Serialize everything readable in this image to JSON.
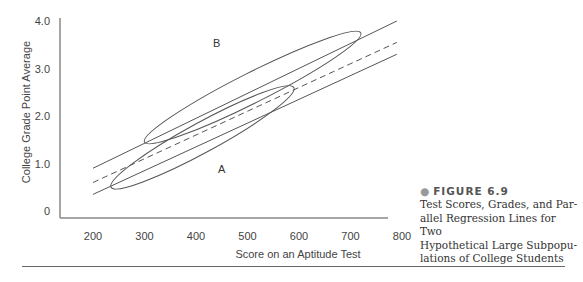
{
  "chart_data": {
    "type": "line",
    "title": "",
    "xlabel": "Score on an Aptitude Test",
    "ylabel": "College Grade Point Average",
    "xlim": [
      140,
      820
    ],
    "ylim": [
      -0.15,
      4.05
    ],
    "x_ticks": [
      200,
      300,
      400,
      500,
      600,
      700,
      800
    ],
    "x_tick_labels": [
      "200",
      "300",
      "400",
      "500",
      "600",
      "700",
      "800"
    ],
    "y_ticks": [
      0,
      1,
      2,
      3,
      4
    ],
    "y_tick_labels": [
      "0",
      "1.0",
      "2.0",
      "3.0",
      "4.0"
    ],
    "grid": false,
    "series": [
      {
        "name": "Regression line B (upper)",
        "style": "solid",
        "x": [
          200,
          790
        ],
        "y": [
          0.9,
          4.0
        ]
      },
      {
        "name": "Common regression line",
        "style": "dashed",
        "x": [
          200,
          790
        ],
        "y": [
          0.6,
          3.55
        ]
      },
      {
        "name": "Regression line A (lower)",
        "style": "solid",
        "x": [
          200,
          790
        ],
        "y": [
          0.35,
          3.3
        ]
      }
    ],
    "ellipses": [
      {
        "name": "Subpopulation B",
        "label": "B",
        "center": [
          510,
          2.6
        ],
        "x_extent": [
          300,
          720
        ],
        "y_extent": [
          1.45,
          3.75
        ],
        "label_pos": [
          440,
          3.45
        ]
      },
      {
        "name": "Subpopulation A",
        "label": "A",
        "center": [
          410,
          1.5
        ],
        "x_extent": [
          235,
          590
        ],
        "y_extent": [
          0.5,
          2.6
        ],
        "label_pos": [
          450,
          0.8
        ]
      }
    ]
  },
  "caption": {
    "bullet": "●",
    "figure_label": "FIGURE 6.9",
    "lines": [
      "Test Scores, Grades, and Par-",
      "allel Regression Lines for Two",
      "Hypothetical Large Subpopu-",
      "lations of College Students"
    ]
  }
}
